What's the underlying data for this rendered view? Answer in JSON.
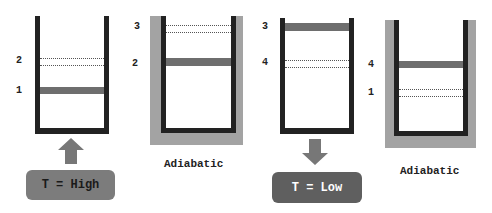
{
  "diagram": {
    "colors": {
      "wall": "#222222",
      "insulation": "#a3a3a3",
      "piston": "#6e6e6e",
      "high_box": "#7c7c7c",
      "low_box": "#5f5f5f",
      "arrow": "#777777"
    },
    "stages": [
      {
        "id": "stage-1",
        "insulated": false,
        "labels": [
          {
            "text": "2"
          },
          {
            "text": "1"
          }
        ],
        "heat_box": {
          "text": "T = High",
          "direction": "up"
        }
      },
      {
        "id": "stage-2",
        "insulated": true,
        "labels": [
          {
            "text": "3"
          },
          {
            "text": "2"
          }
        ],
        "caption": "Adiabatic"
      },
      {
        "id": "stage-3",
        "insulated": false,
        "labels": [
          {
            "text": "3"
          },
          {
            "text": "4"
          }
        ],
        "heat_box": {
          "text": "T = Low",
          "direction": "down"
        }
      },
      {
        "id": "stage-4",
        "insulated": true,
        "labels": [
          {
            "text": "4"
          },
          {
            "text": "1"
          }
        ],
        "caption": "Adiabatic"
      }
    ]
  }
}
